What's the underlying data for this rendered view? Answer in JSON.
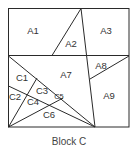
{
  "diagram": {
    "caption": "Block C",
    "region_labels": {
      "A1": "A1",
      "A2": "A2",
      "A3": "A3",
      "A7": "A7",
      "A8": "A8",
      "A9": "A9",
      "C1": "C1",
      "C2": "C2",
      "C3": "C3",
      "C4": "C4",
      "C5": "C5",
      "C6": "C6"
    }
  }
}
